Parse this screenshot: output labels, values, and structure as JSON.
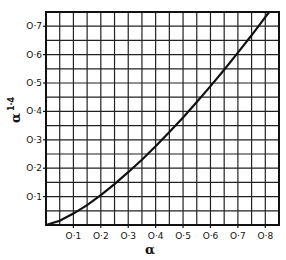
{
  "chart_data": {
    "type": "line",
    "title": "",
    "xlabel": "α",
    "ylabel": "α^1·4",
    "ylabel_base": "α",
    "ylabel_exponent": "1·4",
    "xlim": [
      0,
      0.85
    ],
    "ylim": [
      0,
      0.75
    ],
    "grid": true,
    "grid_step_x": 0.05,
    "grid_step_y": 0.05,
    "legend": null,
    "x_ticks": [
      {
        "value": 0.1,
        "label": "O·1"
      },
      {
        "value": 0.2,
        "label": "O·2"
      },
      {
        "value": 0.3,
        "label": "O·3"
      },
      {
        "value": 0.4,
        "label": "O·4"
      },
      {
        "value": 0.5,
        "label": "O·5"
      },
      {
        "value": 0.6,
        "label": "O·6"
      },
      {
        "value": 0.7,
        "label": "O·7"
      },
      {
        "value": 0.8,
        "label": "O·8"
      }
    ],
    "y_ticks": [
      {
        "value": 0.1,
        "label": "O·1"
      },
      {
        "value": 0.2,
        "label": "O·2"
      },
      {
        "value": 0.3,
        "label": "O·3"
      },
      {
        "value": 0.4,
        "label": "O·4"
      },
      {
        "value": 0.5,
        "label": "O·5"
      },
      {
        "value": 0.6,
        "label": "O·6"
      },
      {
        "value": 0.7,
        "label": "O·7"
      }
    ],
    "series": [
      {
        "name": "α^1.4",
        "x": [
          0,
          0.05,
          0.1,
          0.15,
          0.2,
          0.25,
          0.3,
          0.35,
          0.4,
          0.45,
          0.5,
          0.55,
          0.6,
          0.65,
          0.7,
          0.75,
          0.8,
          0.814
        ],
        "y": [
          0,
          0.015,
          0.04,
          0.07,
          0.105,
          0.144,
          0.186,
          0.23,
          0.277,
          0.327,
          0.379,
          0.433,
          0.489,
          0.547,
          0.607,
          0.668,
          0.732,
          0.75
        ]
      }
    ]
  },
  "colors": {
    "line": "#111111",
    "grid": "#222222",
    "background": "#ffffff"
  }
}
